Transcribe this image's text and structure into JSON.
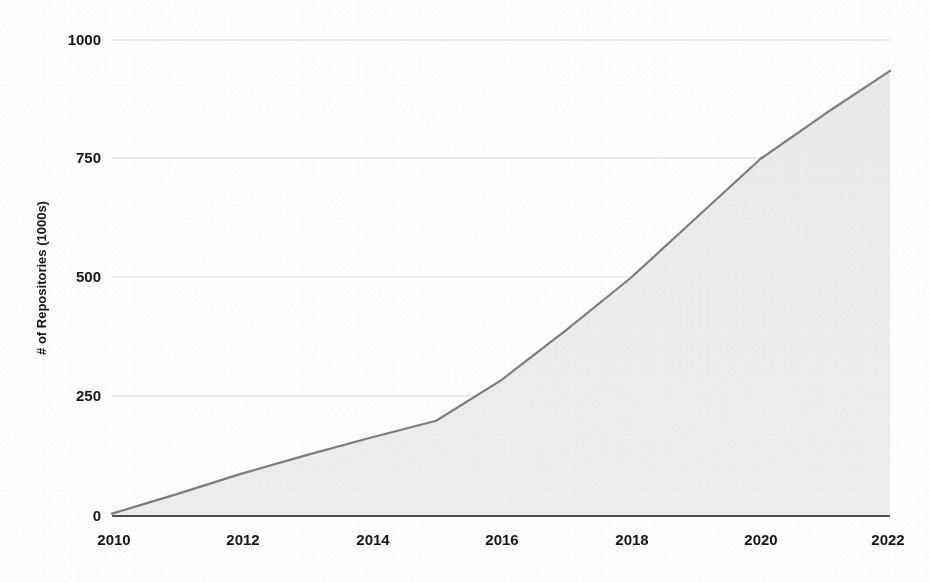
{
  "chart_data": {
    "type": "area",
    "title": "",
    "subtitle": "",
    "xlabel": "",
    "ylabel": "# of Repositories (1000s)",
    "x": [
      2010,
      2011,
      2012,
      2013,
      2014,
      2015,
      2016,
      2017,
      2018,
      2019,
      2020,
      2021,
      2022
    ],
    "values": [
      5,
      46,
      89,
      128,
      165,
      200,
      285,
      390,
      500,
      625,
      750,
      845,
      935
    ],
    "series": [
      {
        "name": "# of Repositories (1000s)",
        "values": [
          5,
          46,
          89,
          128,
          165,
          200,
          285,
          390,
          500,
          625,
          750,
          845,
          935
        ]
      }
    ],
    "categories": [
      "2010",
      "2011",
      "2012",
      "2013",
      "2014",
      "2015",
      "2016",
      "2017",
      "2018",
      "2019",
      "2020",
      "2021",
      "2022"
    ],
    "xlim": [
      2010,
      2022
    ],
    "ylim": [
      0,
      1000
    ],
    "xticks": [
      2010,
      2012,
      2014,
      2016,
      2018,
      2020,
      2022
    ],
    "xtick_labels": [
      "2010",
      "2012",
      "2014",
      "2016",
      "2018",
      "2020",
      "2022"
    ],
    "yticks": [
      0,
      250,
      500,
      750,
      1000
    ],
    "ytick_labels": [
      "0",
      "250",
      "500",
      "750",
      "1000"
    ],
    "grid": true,
    "grid_axis": "y",
    "legend": false,
    "legend_position": "none",
    "annotations": [],
    "colors": {
      "line": "#7a7a7a",
      "fill": "#ebebeb",
      "grid": "#d8d8d8",
      "axis": "#4a4a4a",
      "text": "#161616",
      "background": "#fefefe"
    }
  },
  "axes": {
    "y_axis_title": "# of Repositories (1000s)",
    "x_axis_title": "",
    "y_ticks": [
      {
        "label": "1000",
        "value": 1000
      },
      {
        "label": "750",
        "value": 750
      },
      {
        "label": "500",
        "value": 500
      },
      {
        "label": "250",
        "value": 250
      },
      {
        "label": "0",
        "value": 0
      }
    ],
    "x_ticks": [
      {
        "label": "2010",
        "value": 2010
      },
      {
        "label": "2012",
        "value": 2012
      },
      {
        "label": "2014",
        "value": 2014
      },
      {
        "label": "2016",
        "value": 2016
      },
      {
        "label": "2018",
        "value": 2018
      },
      {
        "label": "2020",
        "value": 2020
      },
      {
        "label": "2022",
        "value": 2022
      }
    ]
  }
}
